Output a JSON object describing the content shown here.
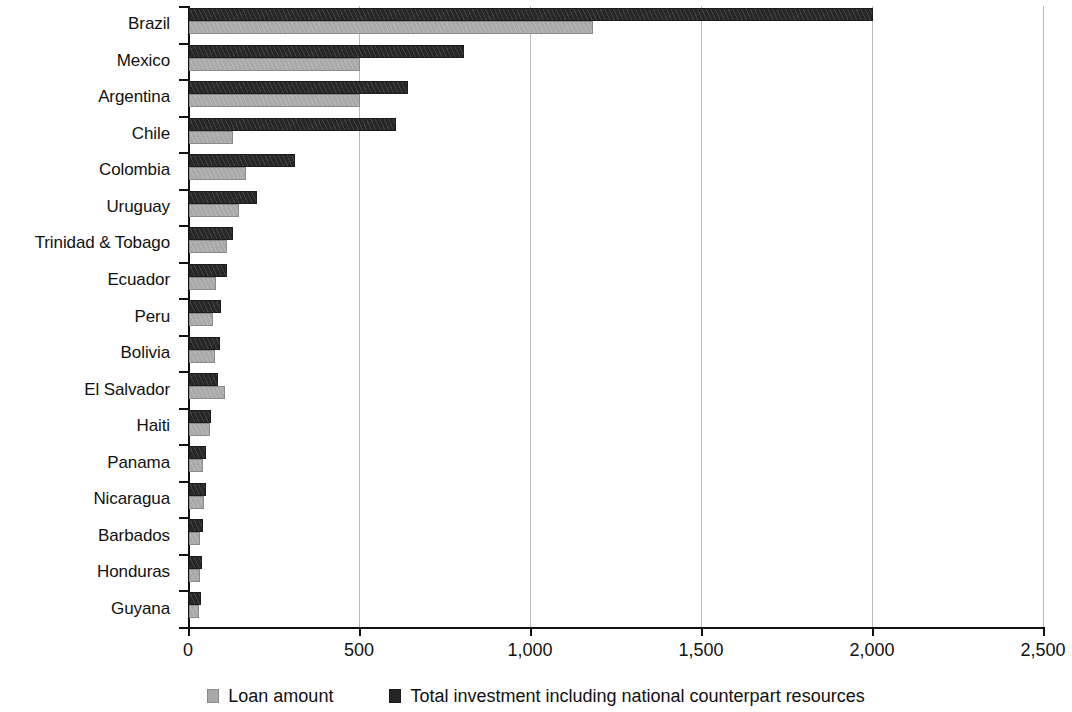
{
  "chart_data": {
    "type": "bar",
    "orientation": "horizontal",
    "title": "",
    "subtitle": "",
    "xlabel": "",
    "ylabel": "",
    "xlim": [
      0,
      2500
    ],
    "xticks": [
      0,
      500,
      1000,
      1500,
      2000,
      2500
    ],
    "xticklabels": [
      "0",
      "500",
      "1,000",
      "1,500",
      "2,000",
      "2,500"
    ],
    "grid": "vertical",
    "legend_position": "bottom",
    "categories": [
      "Brazil",
      "Mexico",
      "Argentina",
      "Chile",
      "Colombia",
      "Uruguay",
      "Trinidad & Tobago",
      "Ecuador",
      "Peru",
      "Bolivia",
      "El Salvador",
      "Haiti",
      "Panama",
      "Nicaragua",
      "Barbados",
      "Honduras",
      "Guyana"
    ],
    "series": [
      {
        "name": "Total investment including national counterpart resources",
        "color": "#262626",
        "values": [
          2000,
          805,
          640,
          605,
          310,
          200,
          128,
          110,
          95,
          90,
          85,
          65,
          50,
          50,
          42,
          38,
          35
        ]
      },
      {
        "name": "Loan amount",
        "color": "#a9a9a9",
        "values": [
          1180,
          500,
          500,
          128,
          167,
          145,
          111,
          80,
          70,
          75,
          105,
          62,
          42,
          45,
          32,
          32,
          30
        ]
      }
    ]
  },
  "legend": {
    "items": [
      {
        "label": "Loan amount",
        "swatch": "loan"
      },
      {
        "label": "Total investment including national counterpart resources",
        "swatch": "total"
      }
    ]
  }
}
